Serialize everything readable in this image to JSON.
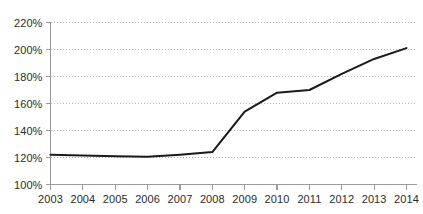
{
  "chart_data": {
    "type": "line",
    "title": "",
    "subtitle": "",
    "xlabel": "",
    "ylabel": "",
    "categories": [
      "2003",
      "2004",
      "2005",
      "2006",
      "2007",
      "2008",
      "2009",
      "2010",
      "2011",
      "2012",
      "2013",
      "2014"
    ],
    "x": [
      2003,
      2004,
      2005,
      2006,
      2007,
      2008,
      2009,
      2010,
      2011,
      2012,
      2013,
      2014
    ],
    "values": [
      122,
      121.5,
      121,
      120.5,
      122,
      124,
      154,
      168,
      170,
      182,
      193,
      201
    ],
    "series": [
      {
        "name": "",
        "values": [
          122,
          121.5,
          121,
          120.5,
          122,
          124,
          154,
          168,
          170,
          182,
          193,
          201
        ]
      }
    ],
    "ylim": [
      100,
      220
    ],
    "xlim": [
      2003,
      2014
    ],
    "y_ticks": [
      100,
      120,
      140,
      160,
      180,
      200,
      220
    ],
    "y_tick_labels": [
      "100%",
      "120%",
      "140%",
      "160%",
      "180%",
      "200%",
      "220%"
    ],
    "x_ticks": [
      2003,
      2004,
      2005,
      2006,
      2007,
      2008,
      2009,
      2010,
      2011,
      2012,
      2013,
      2014
    ],
    "x_tick_labels": [
      "2003",
      "2004",
      "2005",
      "2006",
      "2007",
      "2008",
      "2009",
      "2010",
      "2011",
      "2012",
      "2013",
      "2014"
    ],
    "grid": "horizontal-dotted",
    "legend": "none",
    "value_suffix": "%",
    "colors": {
      "line": "#1a1a1a",
      "gridline": "#b9b9b9",
      "axis": "#9a9a9a",
      "text": "#2b2b2b",
      "background": "#ffffff"
    },
    "line_width": 2,
    "markers": "none",
    "annotations": []
  }
}
